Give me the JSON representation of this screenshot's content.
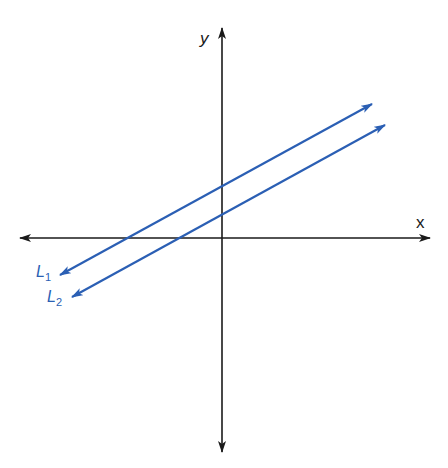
{
  "diagram": {
    "type": "coordinate-plane-parallel-lines",
    "colors": {
      "axis": "#1a1a1a",
      "lines": "#2b5fb4",
      "background": "#ffffff"
    },
    "axes": {
      "x_label": "x",
      "y_label": "y",
      "origin_px": [
        222,
        238
      ],
      "x_axis_px": {
        "from": [
          20,
          238
        ],
        "to": [
          430,
          238
        ]
      },
      "y_axis_px": {
        "from": [
          222,
          452
        ],
        "to": [
          222,
          28
        ]
      }
    },
    "lines": [
      {
        "name": "L1",
        "label_main": "L",
        "label_sub": "1",
        "from_px": [
          60,
          275
        ],
        "to_px": [
          372,
          104
        ],
        "y_intercept_px": [
          222,
          185
        ],
        "x_intercept_px": [
          128,
          238
        ]
      },
      {
        "name": "L2",
        "label_main": "L",
        "label_sub": "2",
        "from_px": [
          72,
          297
        ],
        "to_px": [
          385,
          125
        ],
        "y_intercept_px": [
          222,
          213
        ],
        "x_intercept_px": [
          175,
          238
        ]
      }
    ]
  }
}
